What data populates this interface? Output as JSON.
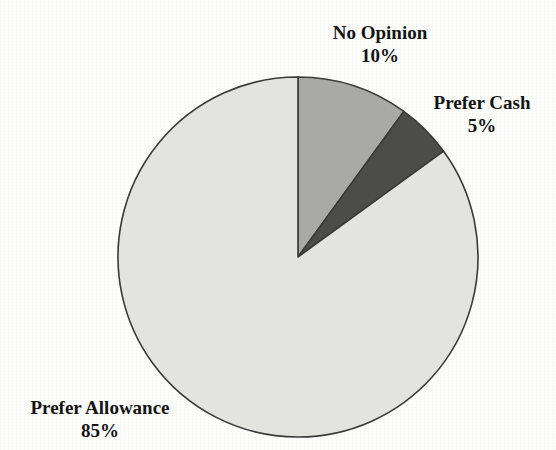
{
  "figure": {
    "cropped_heading": "",
    "background_color": "#fdfdfc"
  },
  "chart_data": {
    "type": "pie",
    "title": "",
    "subtitle": "",
    "xlabel": "",
    "ylabel": "",
    "legend_position": "none",
    "grid": false,
    "start_angle_deg": 0,
    "direction": "clockwise",
    "center": {
      "x": 298,
      "y": 257
    },
    "radius": 180,
    "outline_color": "#3a3a3a",
    "categories": [
      "No Opinion",
      "Prefer Cash",
      "Prefer  Allowance"
    ],
    "values": [
      10,
      5,
      85
    ],
    "value_suffix": "%",
    "colors": [
      "#a9a9a7",
      "#4c4c4a",
      "#e3e3e0"
    ],
    "slices": [
      {
        "label": "No Opinion",
        "value": 10,
        "value_text": "10%",
        "color": "#a9a9a7",
        "start_angle_deg": 0,
        "end_angle_deg": 36
      },
      {
        "label": "Prefer Cash",
        "value": 5,
        "value_text": "5%",
        "color": "#4c4c4a",
        "start_angle_deg": 36,
        "end_angle_deg": 54
      },
      {
        "label": "Prefer  Allowance",
        "value": 85,
        "value_text": "85%",
        "color": "#e3e3e0",
        "start_angle_deg": 54,
        "end_angle_deg": 360
      }
    ],
    "annotations": [
      {
        "name": "no-opinion",
        "label": "No Opinion",
        "value_text": "10%"
      },
      {
        "name": "prefer-cash",
        "label": "Prefer Cash",
        "value_text": "5%"
      },
      {
        "name": "prefer-allowance",
        "label": "Prefer  Allowance",
        "value_text": "85%"
      }
    ]
  }
}
